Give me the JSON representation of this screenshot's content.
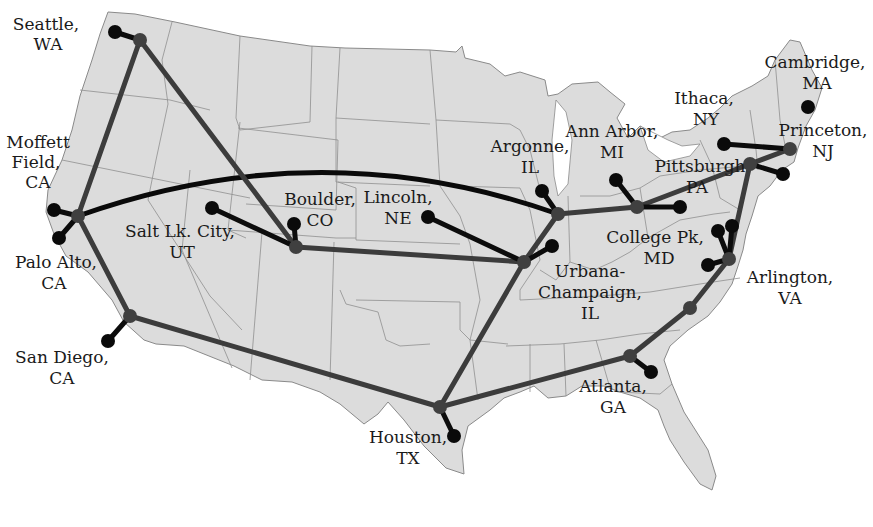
{
  "map": {
    "title": "",
    "region": "Continental United States",
    "colors": {
      "land": "#dcdcdc",
      "state_border": "#8f8f8f",
      "backbone_link": "#3c3c3c",
      "site_link": "#0c0c0c",
      "hub_node": "#404040",
      "site_node": "#0a0a0a",
      "background": "#ffffff"
    },
    "sites": [
      {
        "id": "seattle",
        "line1": "Seattle,",
        "line2": "WA"
      },
      {
        "id": "moffett",
        "line1": "Moffett",
        "line2": "Field,",
        "line3": "CA"
      },
      {
        "id": "paloalto",
        "line1": "Palo Alto,",
        "line2": "CA"
      },
      {
        "id": "sandiego",
        "line1": "San Diego,",
        "line2": "CA"
      },
      {
        "id": "saltlake",
        "line1": "Salt Lk. City,",
        "line2": "UT"
      },
      {
        "id": "boulder",
        "line1": "Boulder,",
        "line2": "CO"
      },
      {
        "id": "lincoln",
        "line1": "Lincoln,",
        "line2": "NE"
      },
      {
        "id": "argonne",
        "line1": "Argonne,",
        "line2": "IL"
      },
      {
        "id": "annarbor",
        "line1": "Ann Arbor,",
        "line2": "MI"
      },
      {
        "id": "urbana",
        "line1": "Urbana-",
        "line2": "Champaign,",
        "line3": "IL"
      },
      {
        "id": "houston",
        "line1": "Houston,",
        "line2": "TX"
      },
      {
        "id": "atlanta",
        "line1": "Atlanta,",
        "line2": "GA"
      },
      {
        "id": "pittsburgh",
        "line1": "Pittsburgh",
        "line2": "PA"
      },
      {
        "id": "ithaca",
        "line1": "Ithaca,",
        "line2": "NY"
      },
      {
        "id": "cambridge",
        "line1": "Cambridge,",
        "line2": "MA"
      },
      {
        "id": "princeton",
        "line1": "Princeton,",
        "line2": "NJ"
      },
      {
        "id": "collegepk",
        "line1": "College Pk,",
        "line2": "MD"
      },
      {
        "id": "arlington",
        "line1": "Arlington,",
        "line2": "VA"
      }
    ],
    "backbone_links": [
      [
        "Seattle hub",
        "Palo Alto hub"
      ],
      [
        "Seattle hub",
        "Boulder hub"
      ],
      [
        "Palo Alto hub",
        "San Diego hub"
      ],
      [
        "San Diego hub",
        "Houston hub"
      ],
      [
        "Boulder hub",
        "Urbana hub"
      ],
      [
        "Houston hub",
        "Urbana hub"
      ],
      [
        "Houston hub",
        "Atlanta hub"
      ],
      [
        "Urbana hub",
        "Argonne hub"
      ],
      [
        "Argonne hub",
        "Ann Arbor hub"
      ],
      [
        "Ann Arbor hub",
        "Pittsburgh hub"
      ],
      [
        "Pittsburgh hub",
        "Princeton hub"
      ],
      [
        "Pittsburgh hub",
        "Arlington hub"
      ],
      [
        "Atlanta hub",
        "Arlington hub"
      ]
    ],
    "long_haul_links": [
      [
        "Palo Alto hub",
        "Argonne hub"
      ]
    ]
  }
}
